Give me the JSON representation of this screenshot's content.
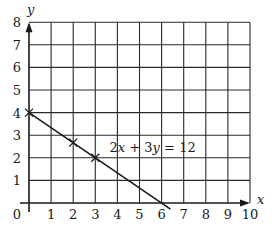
{
  "chart_data": {
    "type": "line",
    "title": "",
    "xlabel": "x",
    "ylabel": "y",
    "xlim": [
      0,
      10
    ],
    "ylim": [
      0,
      8
    ],
    "grid": true,
    "x_ticks": [
      "0",
      "1",
      "2",
      "3",
      "4",
      "5",
      "6",
      "7",
      "8",
      "9",
      "10"
    ],
    "y_ticks": [
      "1",
      "2",
      "3",
      "4",
      "5",
      "6",
      "7",
      "8"
    ],
    "origin_label": "0",
    "series": [
      {
        "name": "2x + 3y = 12",
        "equation": "2x + 3y = 12",
        "line_from": [
          0,
          4
        ],
        "line_to": [
          6.4,
          -0.27
        ],
        "marked_points": [
          [
            0,
            4
          ],
          [
            2,
            2.67
          ],
          [
            3,
            2
          ]
        ]
      }
    ],
    "annotations": [
      {
        "text": "2x + 3y = 12",
        "x": 3.6,
        "y": 2.5
      }
    ],
    "colors": {
      "ink": "#1a1a1a",
      "grid": "#2a2a2a",
      "background": "#ffffff"
    }
  }
}
